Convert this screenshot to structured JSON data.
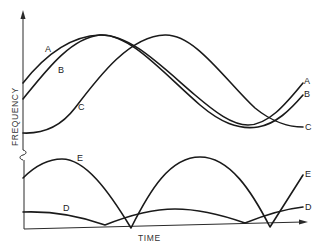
{
  "diagram": {
    "axes": {
      "y_label": "FREQUENCY",
      "x_label": "TIME",
      "y_axis_break": true
    },
    "curves": [
      {
        "id": "A",
        "label": "A",
        "group": "upper",
        "shape": "sinusoid",
        "description": "leads, starts highest"
      },
      {
        "id": "B",
        "label": "B",
        "group": "upper",
        "shape": "sinusoid",
        "description": "slightly lagging A"
      },
      {
        "id": "C",
        "label": "C",
        "group": "upper",
        "shape": "sinusoid",
        "description": "phase shifted ~90 degrees from A"
      },
      {
        "id": "E",
        "label": "E",
        "group": "lower",
        "shape": "rectified sinusoid",
        "description": "large amplitude difference frequency"
      },
      {
        "id": "D",
        "label": "D",
        "group": "lower",
        "shape": "rectified sinusoid",
        "description": "small amplitude difference frequency"
      }
    ],
    "labels": {
      "A_left": "A",
      "B_left": "B",
      "C_left": "C",
      "A_right": "A",
      "B_right": "B",
      "C_right": "C",
      "E_left": "E",
      "E_right": "E",
      "D_left": "D",
      "D_right": "D"
    }
  }
}
